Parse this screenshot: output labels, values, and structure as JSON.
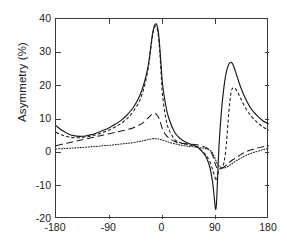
{
  "figure": {
    "width": 287,
    "height": 247,
    "background": "#ffffff",
    "axis_color": "#3a3a3a"
  },
  "axes": {
    "ylabel": "Asymmetry (%)",
    "xlabel": "",
    "yticks": [
      40,
      30,
      20,
      10,
      0,
      -10,
      -20
    ],
    "ytick_labels": [
      "40",
      "30",
      "20",
      "10",
      "0",
      "-10",
      "-20"
    ],
    "xticks": [
      -180,
      -90,
      0,
      90,
      180
    ],
    "xtick_labels": [
      "-180",
      "-90",
      "0",
      "90",
      "180"
    ],
    "xlim": [
      -180,
      180
    ],
    "ylim": [
      -20,
      40
    ],
    "grid": false,
    "tick_direction": "in",
    "ticks_all_sides": true
  },
  "chart_data": {
    "type": "line",
    "title": "",
    "xlabel": "",
    "ylabel": "Asymmetry (%)",
    "xlim": [
      -180,
      180
    ],
    "ylim": [
      -20,
      40
    ],
    "xticks": [
      -180,
      -90,
      0,
      90,
      180
    ],
    "yticks": [
      40,
      30,
      20,
      10,
      0,
      -10,
      -20
    ],
    "grid": false,
    "legend": null,
    "legend_position": "none",
    "x": [
      -180,
      -170,
      -160,
      -150,
      -140,
      -130,
      -120,
      -110,
      -100,
      -90,
      -80,
      -70,
      -60,
      -50,
      -40,
      -35,
      -30,
      -25,
      -22,
      -20,
      -18,
      -16,
      -14,
      -12,
      -10,
      -8,
      -6,
      -4,
      -2,
      0,
      5,
      10,
      20,
      30,
      40,
      50,
      60,
      70,
      75,
      80,
      84,
      86,
      88,
      89,
      90,
      91,
      92,
      94,
      96,
      100,
      104,
      108,
      112,
      116,
      120,
      126,
      132,
      140,
      150,
      160,
      170,
      180
    ],
    "series": [
      {
        "name": "solid",
        "style": "solid",
        "color": "#1a1a1a",
        "values": [
          8.0,
          6.6,
          5.6,
          5.0,
          4.8,
          4.9,
          5.3,
          5.9,
          6.6,
          7.4,
          8.4,
          9.6,
          11.2,
          13.3,
          16.4,
          18.6,
          21.4,
          25.2,
          28.5,
          31.4,
          34.2,
          36.4,
          37.8,
          38.5,
          38.4,
          37.2,
          34.5,
          30.2,
          25.2,
          20.5,
          14.6,
          10.6,
          6.2,
          4.1,
          3.0,
          2.3,
          1.5,
          -0.4,
          -1.9,
          -4.4,
          -8.2,
          -11.0,
          -14.5,
          -16.4,
          -17.1,
          -16.0,
          -12.5,
          -4.0,
          3.5,
          13.2,
          19.8,
          24.2,
          26.4,
          27.0,
          26.0,
          22.8,
          19.6,
          16.2,
          13.0,
          11.0,
          9.4,
          8.5
        ]
      },
      {
        "name": "short-dashed",
        "style": "dashed",
        "color": "#1a1a1a",
        "values": [
          6.0,
          5.2,
          4.7,
          4.4,
          4.4,
          4.6,
          4.9,
          5.4,
          6.0,
          6.7,
          7.6,
          8.7,
          10.1,
          12.1,
          15.0,
          17.2,
          20.2,
          24.4,
          27.8,
          30.8,
          33.6,
          35.8,
          37.2,
          37.9,
          37.6,
          36.2,
          33.2,
          28.5,
          22.6,
          17.2,
          10.8,
          7.2,
          4.0,
          2.9,
          2.4,
          2.0,
          1.4,
          -0.2,
          -1.2,
          -2.8,
          -4.8,
          -5.9,
          -7.0,
          -7.6,
          -8.2,
          -8.5,
          -8.0,
          -6.3,
          -5.2,
          -4.6,
          -3.0,
          2.6,
          12.0,
          18.0,
          19.4,
          18.4,
          16.2,
          13.4,
          10.8,
          9.0,
          7.6,
          6.6
        ]
      },
      {
        "name": "long-dashed",
        "style": "long-dashed",
        "color": "#1a1a1a",
        "values": [
          2.0,
          2.4,
          2.8,
          3.2,
          3.6,
          4.0,
          4.4,
          4.8,
          5.2,
          5.6,
          6.0,
          6.4,
          6.8,
          7.3,
          8.1,
          8.6,
          9.3,
          10.2,
          10.7,
          11.1,
          11.4,
          11.6,
          11.7,
          11.6,
          11.4,
          10.9,
          10.2,
          9.2,
          8.1,
          7.0,
          5.4,
          4.4,
          3.3,
          2.8,
          2.6,
          2.4,
          2.2,
          1.7,
          1.3,
          0.6,
          -0.6,
          -1.6,
          -2.8,
          -3.4,
          -3.9,
          -4.3,
          -4.6,
          -4.9,
          -5.0,
          -4.8,
          -4.4,
          -3.8,
          -3.2,
          -2.6,
          -2.1,
          -1.4,
          -0.7,
          0.1,
          0.8,
          1.3,
          1.7,
          2.0
        ]
      },
      {
        "name": "dotted",
        "style": "dotted",
        "color": "#1a1a1a",
        "values": [
          1.0,
          1.1,
          1.2,
          1.3,
          1.4,
          1.5,
          1.7,
          1.8,
          2.0,
          2.1,
          2.3,
          2.5,
          2.7,
          2.9,
          3.2,
          3.4,
          3.6,
          3.8,
          3.9,
          4.0,
          4.0,
          4.1,
          4.1,
          4.1,
          4.1,
          4.0,
          4.0,
          3.9,
          3.8,
          3.7,
          3.4,
          3.1,
          2.6,
          2.2,
          1.9,
          1.7,
          1.5,
          1.2,
          1.0,
          0.6,
          -0.1,
          -0.7,
          -1.5,
          -2.0,
          -2.4,
          -2.8,
          -3.2,
          -3.8,
          -4.2,
          -4.6,
          -4.7,
          -4.5,
          -4.1,
          -3.6,
          -3.1,
          -2.4,
          -1.8,
          -1.0,
          -0.3,
          0.3,
          0.8,
          1.2
        ]
      }
    ]
  }
}
